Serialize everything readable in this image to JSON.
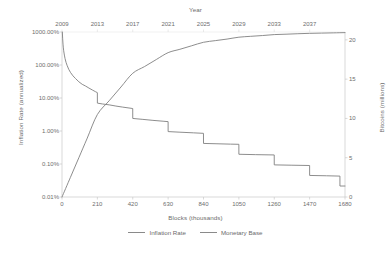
{
  "chart_data": {
    "type": "line",
    "title": "",
    "xlabel": "Blocks (thousands)",
    "ylabel": "Inflation Rate (annualized)",
    "y2label": "Bitcoins (millions)",
    "x2label": "Year",
    "grid": false,
    "legend_position": "bottom",
    "x_ticks": [
      "0",
      "210",
      "420",
      "630",
      "840",
      "1050",
      "1260",
      "1470",
      "1680"
    ],
    "x_tick_values": [
      0,
      210,
      420,
      630,
      840,
      1050,
      1260,
      1470,
      1680
    ],
    "xlim": [
      0,
      1680
    ],
    "x2_ticks": [
      "2009",
      "2013",
      "2017",
      "2021",
      "2025",
      "2029",
      "2033",
      "2037"
    ],
    "x2_tick_values": [
      2009,
      2013,
      2017,
      2021,
      2025,
      2029,
      2033,
      2037
    ],
    "x2_tick_blocks": [
      0,
      210,
      420,
      630,
      840,
      1050,
      1260,
      1470
    ],
    "y_ticks": [
      "1000.00%",
      "100.00%",
      "10.00%",
      "1.00%",
      "0.10%",
      "0.01%"
    ],
    "y_tick_values": [
      1000,
      100,
      10,
      1,
      0.1,
      0.01
    ],
    "y_scale": "log",
    "ylim": [
      0.01,
      1000
    ],
    "y2_ticks": [
      "0",
      "5",
      "10",
      "15",
      "20"
    ],
    "y2_tick_values": [
      0,
      5,
      10,
      15,
      20
    ],
    "y2_scale": "linear",
    "y2lim": [
      0,
      21
    ],
    "series": [
      {
        "name": "Inflation Rate",
        "axis": "left",
        "color": "#808080",
        "style": "step",
        "points": [
          [
            2,
            1000
          ],
          [
            4,
            620
          ],
          [
            6,
            430
          ],
          [
            8,
            330
          ],
          [
            10,
            270
          ],
          [
            14,
            200
          ],
          [
            18,
            158
          ],
          [
            24,
            120
          ],
          [
            30,
            98
          ],
          [
            40,
            74
          ],
          [
            50,
            60
          ],
          [
            65,
            47
          ],
          [
            80,
            39
          ],
          [
            100,
            31
          ],
          [
            120,
            26
          ],
          [
            140,
            23
          ],
          [
            160,
            20
          ],
          [
            180,
            17.5
          ],
          [
            200,
            15.4
          ],
          [
            209.9,
            14.5
          ],
          [
            210,
            7.0
          ],
          [
            240,
            6.6
          ],
          [
            280,
            6.2
          ],
          [
            320,
            5.7
          ],
          [
            360,
            5.3
          ],
          [
            419.9,
            4.8
          ],
          [
            420,
            2.4
          ],
          [
            480,
            2.25
          ],
          [
            540,
            2.1
          ],
          [
            600,
            1.98
          ],
          [
            629.9,
            1.92
          ],
          [
            630,
            0.96
          ],
          [
            700,
            0.92
          ],
          [
            780,
            0.88
          ],
          [
            839.9,
            0.85
          ],
          [
            840,
            0.42
          ],
          [
            920,
            0.41
          ],
          [
            1000,
            0.4
          ],
          [
            1049.9,
            0.395
          ],
          [
            1050,
            0.197
          ],
          [
            1150,
            0.192
          ],
          [
            1259.9,
            0.188
          ],
          [
            1260,
            0.094
          ],
          [
            1360,
            0.092
          ],
          [
            1469.9,
            0.09
          ],
          [
            1470,
            0.045
          ],
          [
            1570,
            0.044
          ],
          [
            1649.9,
            0.043
          ],
          [
            1650,
            0.0215
          ],
          [
            1680,
            0.0215
          ]
        ],
        "description": "Annualized Bitcoin monetary inflation rate on a log scale, halving every 210,000 blocks"
      },
      {
        "name": "Monetary Base",
        "axis": "right",
        "color": "#808080",
        "style": "smooth",
        "points": [
          [
            0,
            0
          ],
          [
            50,
            2.5
          ],
          [
            100,
            5.0
          ],
          [
            150,
            7.5
          ],
          [
            210,
            10.5
          ],
          [
            280,
            12.25
          ],
          [
            350,
            14.0
          ],
          [
            420,
            15.75
          ],
          [
            490,
            16.6
          ],
          [
            560,
            17.5
          ],
          [
            630,
            18.375
          ],
          [
            700,
            18.8
          ],
          [
            770,
            19.25
          ],
          [
            840,
            19.69
          ],
          [
            910,
            19.9
          ],
          [
            980,
            20.1
          ],
          [
            1050,
            20.34
          ],
          [
            1120,
            20.45
          ],
          [
            1190,
            20.55
          ],
          [
            1260,
            20.67
          ],
          [
            1330,
            20.72
          ],
          [
            1400,
            20.78
          ],
          [
            1470,
            20.83
          ],
          [
            1540,
            20.86
          ],
          [
            1610,
            20.89
          ],
          [
            1680,
            20.92
          ]
        ],
        "description": "Cumulative bitcoins issued in millions, asymptotically approaching 21 million"
      }
    ]
  },
  "legend": {
    "items": [
      {
        "label": "Inflation Rate"
      },
      {
        "label": "Monetary Base"
      }
    ]
  },
  "watermark": {
    "text": ""
  }
}
